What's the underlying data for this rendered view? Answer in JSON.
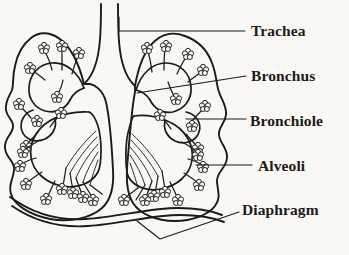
{
  "figure": {
    "background_color": "#faf8f4",
    "ink_color": "#1b1b1b",
    "width": 349,
    "height": 255
  },
  "labels": [
    {
      "id": "trachea",
      "text": "Trachea",
      "leader": "horizontal"
    },
    {
      "id": "bronchus",
      "text": "Bronchus",
      "leader": "diagonal-up"
    },
    {
      "id": "bronchiole",
      "text": "Bronchiole",
      "leader": "horizontal"
    },
    {
      "id": "alveoli",
      "text": "Alveoli",
      "leader": "horizontal"
    },
    {
      "id": "diaphragm",
      "text": "Diaphragm",
      "leader": "bent-v"
    }
  ],
  "structures": [
    {
      "name": "trachea",
      "description": "vertical airway tube at top center"
    },
    {
      "name": "left-lung",
      "description": "left lung outline with lobed border"
    },
    {
      "name": "right-lung",
      "description": "right lung outline with lobed border"
    },
    {
      "name": "bronchus",
      "description": "main branching airway inside each lung"
    },
    {
      "name": "bronchiole",
      "description": "fine branching tubes ending in alveoli"
    },
    {
      "name": "alveoli",
      "description": "grape-like clusters of small sacs"
    },
    {
      "name": "diaphragm",
      "description": "curved muscle sheet below the lungs"
    }
  ]
}
